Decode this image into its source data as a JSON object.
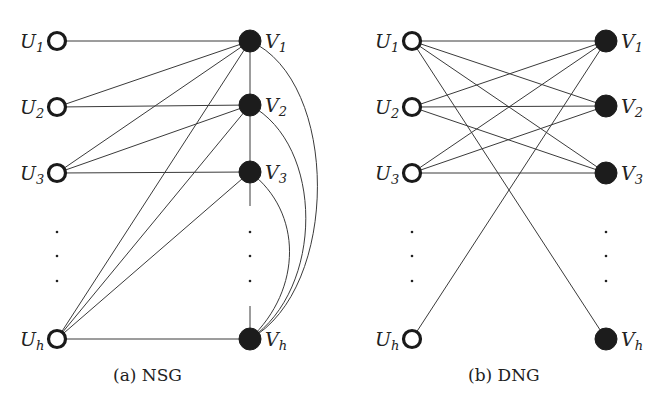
{
  "figure": {
    "panels": [
      {
        "id": "nsg",
        "caption": "(a) NSG",
        "left_nodes": [
          {
            "id": "U1",
            "base": "U",
            "sub": "1",
            "x": 57,
            "y": 41
          },
          {
            "id": "U2",
            "base": "U",
            "sub": "2",
            "x": 57,
            "y": 107
          },
          {
            "id": "U3",
            "base": "U",
            "sub": "3",
            "x": 57,
            "y": 173
          },
          {
            "id": "Uh",
            "base": "U",
            "sub": "h",
            "x": 57,
            "y": 339
          }
        ],
        "right_nodes": [
          {
            "id": "V1",
            "base": "V",
            "sub": "1",
            "x": 250,
            "y": 41
          },
          {
            "id": "V2",
            "base": "V",
            "sub": "2",
            "x": 250,
            "y": 105
          },
          {
            "id": "V3",
            "base": "V",
            "sub": "3",
            "x": 250,
            "y": 172
          },
          {
            "id": "Vh",
            "base": "V",
            "sub": "h",
            "x": 250,
            "y": 339
          }
        ],
        "edges": [
          [
            "U1",
            "V1"
          ],
          [
            "U2",
            "V1"
          ],
          [
            "U2",
            "V2"
          ],
          [
            "U3",
            "V1"
          ],
          [
            "U3",
            "V2"
          ],
          [
            "U3",
            "V3"
          ],
          [
            "Uh",
            "V1"
          ],
          [
            "Uh",
            "V2"
          ],
          [
            "Uh",
            "V3"
          ],
          [
            "Uh",
            "Vh"
          ],
          [
            "V1",
            "V2"
          ],
          [
            "V2",
            "V3"
          ]
        ],
        "arcs": [
          [
            "V1",
            "Vh"
          ],
          [
            "V2",
            "Vh"
          ],
          [
            "V3",
            "Vh"
          ]
        ],
        "ellipsis": "⋮"
      },
      {
        "id": "dng",
        "caption": "(b) DNG",
        "left_nodes": [
          {
            "id": "U1",
            "base": "U",
            "sub": "1",
            "x": 412,
            "y": 41
          },
          {
            "id": "U2",
            "base": "U",
            "sub": "2",
            "x": 412,
            "y": 107
          },
          {
            "id": "U3",
            "base": "U",
            "sub": "3",
            "x": 412,
            "y": 173
          },
          {
            "id": "Uh",
            "base": "U",
            "sub": "h",
            "x": 412,
            "y": 339
          }
        ],
        "right_nodes": [
          {
            "id": "V1",
            "base": "V",
            "sub": "1",
            "x": 606,
            "y": 41
          },
          {
            "id": "V2",
            "base": "V",
            "sub": "2",
            "x": 606,
            "y": 106
          },
          {
            "id": "V3",
            "base": "V",
            "sub": "3",
            "x": 606,
            "y": 173
          },
          {
            "id": "Vh",
            "base": "V",
            "sub": "h",
            "x": 606,
            "y": 339
          }
        ],
        "edges": [
          [
            "U1",
            "V1"
          ],
          [
            "U1",
            "V2"
          ],
          [
            "U1",
            "V3"
          ],
          [
            "U1",
            "Vh"
          ],
          [
            "U2",
            "V1"
          ],
          [
            "U2",
            "V2"
          ],
          [
            "U2",
            "V3"
          ],
          [
            "U3",
            "V1"
          ],
          [
            "U3",
            "V2"
          ],
          [
            "U3",
            "V3"
          ],
          [
            "Uh",
            "V1"
          ]
        ],
        "arcs": [],
        "ellipsis": "⋮"
      }
    ]
  }
}
